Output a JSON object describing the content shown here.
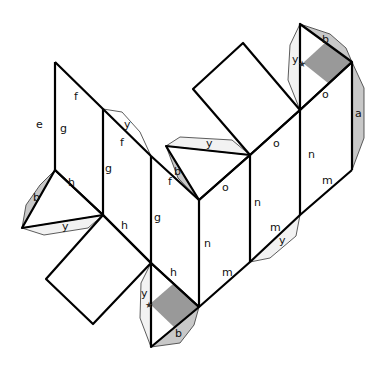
{
  "diagram": {
    "type": "net",
    "colors": {
      "line": "#000000",
      "flap_light": "#f2f2f2",
      "flap_gray": "#c8c8c8",
      "shaded_region": "#999999"
    },
    "labels": [
      {
        "id": "e1",
        "text": "e",
        "x": 36,
        "y": 128
      },
      {
        "id": "g1",
        "text": "g",
        "x": 60,
        "y": 132
      },
      {
        "id": "f1",
        "text": "f",
        "x": 74,
        "y": 100
      },
      {
        "id": "y1",
        "text": "y",
        "x": 124,
        "y": 128
      },
      {
        "id": "f2",
        "text": "f",
        "x": 120,
        "y": 146
      },
      {
        "id": "g2",
        "text": "g",
        "x": 105,
        "y": 172
      },
      {
        "id": "b1",
        "text": "b",
        "x": 174,
        "y": 175
      },
      {
        "id": "f3",
        "text": "f",
        "x": 168,
        "y": 185
      },
      {
        "id": "y2",
        "text": "y",
        "x": 206,
        "y": 147
      },
      {
        "id": "o1",
        "text": "o",
        "x": 273,
        "y": 147
      },
      {
        "id": "o2",
        "text": "o",
        "x": 322,
        "y": 98
      },
      {
        "id": "a1",
        "text": "a",
        "x": 355,
        "y": 117
      },
      {
        "id": "b2",
        "text": "b",
        "x": 322,
        "y": 43
      },
      {
        "id": "y3",
        "text": "y",
        "x": 292,
        "y": 63
      },
      {
        "id": "n1",
        "text": "n",
        "x": 308,
        "y": 158
      },
      {
        "id": "n2",
        "text": "n",
        "x": 254,
        "y": 206
      },
      {
        "id": "o3",
        "text": "o",
        "x": 222,
        "y": 191
      },
      {
        "id": "n3",
        "text": "n",
        "x": 204,
        "y": 247
      },
      {
        "id": "m1",
        "text": "m",
        "x": 322,
        "y": 184
      },
      {
        "id": "m2",
        "text": "m",
        "x": 270,
        "y": 231
      },
      {
        "id": "y4",
        "text": "y",
        "x": 279,
        "y": 244
      },
      {
        "id": "m3",
        "text": "m",
        "x": 222,
        "y": 276
      },
      {
        "id": "g3",
        "text": "g",
        "x": 154,
        "y": 221
      },
      {
        "id": "h1",
        "text": "h",
        "x": 68,
        "y": 186
      },
      {
        "id": "b3",
        "text": "b",
        "x": 33,
        "y": 201
      },
      {
        "id": "y5",
        "text": "y",
        "x": 62,
        "y": 230
      },
      {
        "id": "h2",
        "text": "h",
        "x": 121,
        "y": 229
      },
      {
        "id": "h3",
        "text": "h",
        "x": 170,
        "y": 276
      },
      {
        "id": "y6",
        "text": "y",
        "x": 141,
        "y": 297
      },
      {
        "id": "b4",
        "text": "b",
        "x": 175,
        "y": 337
      }
    ]
  }
}
